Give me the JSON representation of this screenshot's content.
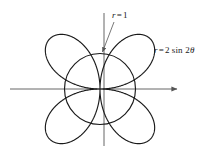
{
  "figure": {
    "background_color": "#ffffff",
    "curve_color": "#1a1a1a",
    "axis_color": "#555555",
    "leader_color": "#555555",
    "width": 216,
    "height": 156
  },
  "labels": {
    "circle": {
      "var": "r",
      "eq": "=",
      "value": "1",
      "full": "r = 1"
    },
    "rose": {
      "var": "r",
      "eq": "=",
      "coefficient": "2",
      "fn": "sin",
      "argument": "2",
      "theta": "θ",
      "full": "r = 2 sin 2θ"
    }
  },
  "axes": {
    "x_axis": {
      "start_x": 10,
      "end_x": 180,
      "y": 89,
      "arrow": "right"
    },
    "y_axis": {
      "x": 104,
      "start_y": 13,
      "end_y": 146,
      "arrow": "none"
    },
    "origin": {
      "x": 104,
      "y": 89
    }
  },
  "leader_line": {
    "from_x": 114,
    "from_y": 22,
    "to_x": 101,
    "to_y": 54,
    "arrow": "to"
  },
  "chart_data": {
    "type": "line",
    "title": "",
    "xlabel": "",
    "ylabel": "",
    "coordinate_system": "polar",
    "grid": false,
    "legend": "inline-annotations",
    "xlim": [
      -2.6,
      2.6
    ],
    "ylim": [
      -2.2,
      2.2
    ],
    "series": [
      {
        "name": "r = 2 sin 2θ",
        "equation": "r = 2 sin 2θ",
        "shape": "four-petaled rose",
        "petal_count": 4,
        "max_radius": 2,
        "petal_axis_angles_deg": [
          45,
          135,
          225,
          315
        ],
        "color": "#1a1a1a"
      },
      {
        "name": "r = 1",
        "equation": "r = 1",
        "shape": "circle",
        "radius": 1,
        "color": "#1a1a1a"
      }
    ],
    "intersections_deg": [
      15,
      75,
      105,
      165,
      195,
      255,
      285,
      345
    ],
    "intersection_radius": 1
  },
  "geometry": {
    "center_x": 100,
    "center_y": 89,
    "unit_px": 35.5
  }
}
